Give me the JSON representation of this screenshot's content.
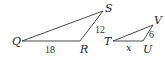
{
  "diagram": {
    "triangles": [
      {
        "name": "QRS",
        "vertices": [
          {
            "label": "Q",
            "x": 22,
            "y": 41
          },
          {
            "label": "R",
            "x": 80,
            "y": 41
          },
          {
            "label": "S",
            "x": 103,
            "y": 11
          }
        ],
        "side_labels": {
          "QR": "18",
          "RS": "12"
        }
      },
      {
        "name": "TUV",
        "vertices": [
          {
            "label": "T",
            "x": 113,
            "y": 41
          },
          {
            "label": "U",
            "x": 143,
            "y": 41
          },
          {
            "label": "V",
            "x": 153,
            "y": 25
          }
        ],
        "side_labels": {
          "TU": "x",
          "UV": "6"
        }
      }
    ],
    "colors": {
      "line": "#333333",
      "text": "#222222"
    }
  }
}
